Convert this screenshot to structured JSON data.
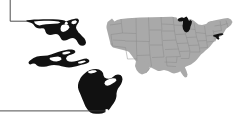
{
  "figure": {
    "width": 249,
    "height": 130,
    "background_color": "#ffffff"
  },
  "colors": {
    "base_state_fill": "#a9a9a9",
    "base_state_border": "#8a8a8a",
    "highlight_fill": "#111111",
    "leader_line": "#3a3a3a",
    "city_marker": "#ffffff"
  },
  "us_map": {
    "name": "contiguous-united-states",
    "fill_label": "gray",
    "highlighted_states": [
      {
        "code": "MI",
        "name": "Michigan",
        "fill_label": "black"
      },
      {
        "code": "MD",
        "name": "Maryland",
        "fill_label": "black"
      }
    ]
  },
  "insets": [
    {
      "id": "maryland-inset",
      "state_code": "MD",
      "state_name": "Maryland",
      "fill_label": "black",
      "marker": {
        "type": "city-dot",
        "fill_label": "white"
      }
    },
    {
      "id": "michigan-upper-peninsula-inset",
      "state_code": "MI",
      "state_name": "Michigan Upper Peninsula",
      "fill_label": "black",
      "marker": null
    },
    {
      "id": "michigan-lower-peninsula-inset",
      "state_code": "MI",
      "state_name": "Michigan Lower Peninsula",
      "fill_label": "black",
      "marker": {
        "type": "city-dot",
        "fill_label": "white"
      }
    }
  ],
  "leader_lines": [
    {
      "id": "maryland-leader",
      "target": "maryland-inset",
      "path_label": "top-edge down then right",
      "color": "#3a3a3a"
    },
    {
      "id": "michigan-leader",
      "target": "michigan-lower-peninsula-inset",
      "path_label": "left-edge horizontal right",
      "color": "#3a3a3a"
    }
  ],
  "labels": {
    "none_visible": ""
  }
}
